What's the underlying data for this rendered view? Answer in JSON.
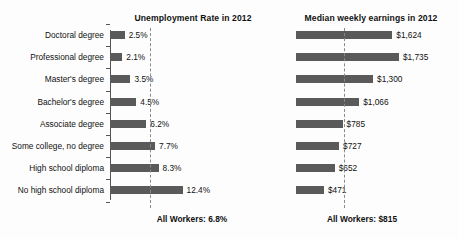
{
  "chart_data": {
    "type": "bar",
    "orientation": "horizontal",
    "panels": [
      {
        "id": "unemployment",
        "title": "Unemployment Rate in 2012",
        "xlabel": "",
        "ylabel": "",
        "unit": "percent",
        "xlim": [
          0,
          14
        ],
        "grid": false,
        "axis_line": true,
        "categories": [
          "Doctoral degree",
          "Professional degree",
          "Master's degree",
          "Bachelor's degree",
          "Associate degree",
          "Some college, no degree",
          "High school diploma",
          "No high school diploma"
        ],
        "values": [
          2.5,
          2.1,
          3.5,
          4.5,
          6.2,
          7.7,
          8.3,
          12.4
        ],
        "value_labels": [
          "2.5%",
          "2.1%",
          "3.5%",
          "4.5%",
          "6.2%",
          "7.7%",
          "8.3%",
          "12.4%"
        ],
        "reference_line": {
          "value": 6.8,
          "label": "All Workers: 6.8%",
          "style": "dashed"
        }
      },
      {
        "id": "earnings",
        "title": "Median weekly earnings in 2012",
        "xlabel": "",
        "ylabel": "",
        "unit": "US dollars",
        "xlim": [
          0,
          1900
        ],
        "grid": false,
        "axis_line": false,
        "categories": [
          "Doctoral degree",
          "Professional degree",
          "Master's degree",
          "Bachelor's degree",
          "Associate degree",
          "Some college, no degree",
          "High school diploma",
          "No high school diploma"
        ],
        "values": [
          1624,
          1735,
          1300,
          1066,
          785,
          727,
          652,
          471
        ],
        "value_labels": [
          "$1,624",
          "$1,735",
          "$1,300",
          "$1,066",
          "$785",
          "$727",
          "$652",
          "$471"
        ],
        "reference_line": {
          "value": 815,
          "label": "All Workers: $815",
          "style": "dashed"
        }
      }
    ],
    "colors": {
      "bar": "#5a5a5a",
      "axis": "#555555",
      "reference_line": "#8a8a8a",
      "text": "#111111",
      "background": "#fdfdfd"
    }
  },
  "categories": [
    "Doctoral degree",
    "Professional degree",
    "Master's degree",
    "Bachelor's degree",
    "Associate degree",
    "Some college, no degree",
    "High school diploma",
    "No high school diploma"
  ],
  "left_panel": {
    "title": "Unemployment Rate in 2012",
    "value_labels": [
      "2.5%",
      "2.1%",
      "3.5%",
      "4.5%",
      "6.2%",
      "7.7%",
      "8.3%",
      "12.4%"
    ],
    "footer": "All Workers: 6.8%"
  },
  "right_panel": {
    "title": "Median weekly earnings in 2012",
    "value_labels": [
      "$1,624",
      "$1,735",
      "$1,300",
      "$1,066",
      "$785",
      "$727",
      "$652",
      "$471"
    ],
    "footer": "All Workers: $815"
  }
}
